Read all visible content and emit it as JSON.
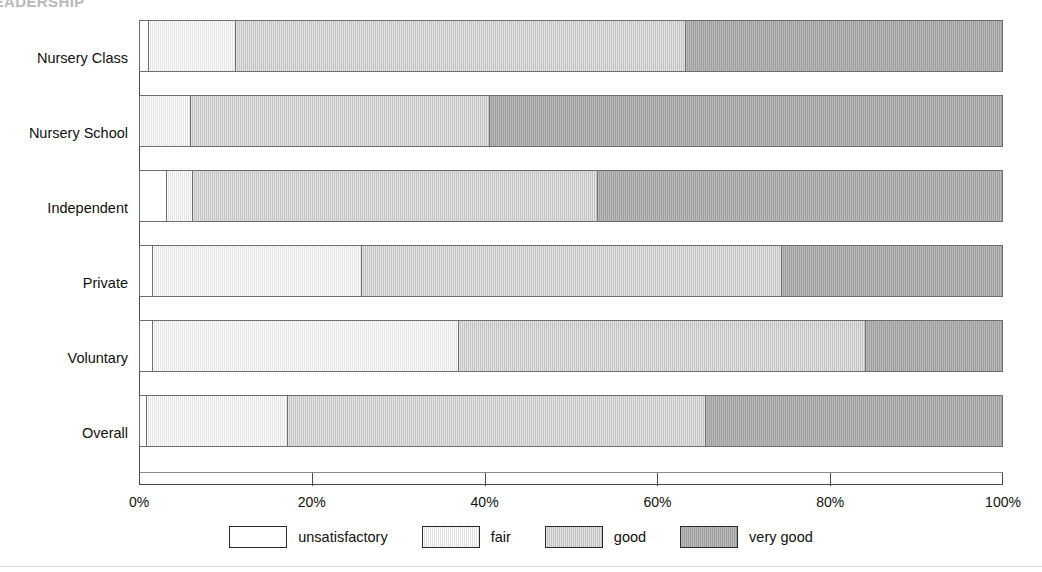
{
  "header": {
    "cropped_title": "LEADERSHIP"
  },
  "chart_data": {
    "type": "bar",
    "orientation": "horizontal",
    "stacked": true,
    "normalized": "percent",
    "title": "",
    "xlabel": "",
    "ylabel": "",
    "xlim": [
      0,
      100
    ],
    "xticks": [
      "0%",
      "20%",
      "40%",
      "60%",
      "80%",
      "100%"
    ],
    "xtick_values": [
      0,
      20,
      40,
      60,
      80,
      100
    ],
    "grid": false,
    "legend_position": "bottom",
    "categories": [
      "Nursery Class",
      "Nursery School",
      "Independent",
      "Private",
      "Voluntary",
      "Overall"
    ],
    "series": [
      {
        "name": "unsatisfactory",
        "color": "#ffffff",
        "values": [
          1.0,
          0.0,
          3.1,
          1.5,
          1.5,
          0.8
        ]
      },
      {
        "name": "fair",
        "color": "#ececec",
        "values": [
          10.1,
          5.9,
          3.0,
          24.3,
          35.5,
          16.4
        ]
      },
      {
        "name": "good",
        "color": "#cccccc",
        "values": [
          52.2,
          34.7,
          47.0,
          48.7,
          47.2,
          48.5
        ]
      },
      {
        "name": "very good",
        "color": "#a6a6a6",
        "values": [
          36.7,
          59.4,
          46.9,
          25.5,
          15.8,
          34.3
        ]
      }
    ],
    "rows": [
      {
        "category": "Nursery Class",
        "unsatisfactory": 1.0,
        "fair": 10.1,
        "good": 52.2,
        "very good": 36.7
      },
      {
        "category": "Nursery School",
        "unsatisfactory": 0.0,
        "fair": 5.9,
        "good": 34.7,
        "very good": 59.4
      },
      {
        "category": "Independent",
        "unsatisfactory": 3.1,
        "fair": 3.0,
        "good": 47.0,
        "very good": 46.9
      },
      {
        "category": "Private",
        "unsatisfactory": 1.5,
        "fair": 24.3,
        "good": 48.7,
        "very good": 25.5
      },
      {
        "category": "Voluntary",
        "unsatisfactory": 1.5,
        "fair": 35.5,
        "good": 47.2,
        "very good": 15.8
      },
      {
        "category": "Overall",
        "unsatisfactory": 0.8,
        "fair": 16.4,
        "good": 48.5,
        "very good": 34.3
      }
    ]
  },
  "legend": {
    "items": [
      {
        "label": "unsatisfactory",
        "swatch": "unsatisfactory"
      },
      {
        "label": "fair",
        "swatch": "fair"
      },
      {
        "label": "good",
        "swatch": "good"
      },
      {
        "label": "very good",
        "swatch": "verygood"
      }
    ]
  }
}
